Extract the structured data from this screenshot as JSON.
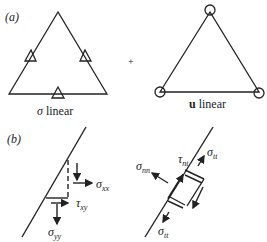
{
  "figure": {
    "part_a": {
      "label": "(a)",
      "left_triangle": {
        "caption_symbol": "σ",
        "caption_text": " linear",
        "marker": "triangle"
      },
      "operator": "+",
      "right_triangle": {
        "caption_symbol": "u",
        "caption_text": " linear",
        "marker": "circle"
      }
    },
    "part_b": {
      "label": "(b)",
      "left": {
        "sigma_xx": {
          "sym": "σ",
          "sub": "xx"
        },
        "tau_xy": {
          "sym": "τ",
          "sub": "xy"
        },
        "sigma_yy": {
          "sym": "σ",
          "sub": "yy"
        }
      },
      "right": {
        "sigma_nn": {
          "sym": "σ",
          "sub": "nn"
        },
        "tau_nt": {
          "sym": "τ",
          "sub": "nt"
        },
        "sigma_tt_top": {
          "sym": "σ",
          "sub": "tt"
        },
        "sigma_tt_bottom": {
          "sym": "σ",
          "sub": "tt"
        }
      }
    }
  }
}
